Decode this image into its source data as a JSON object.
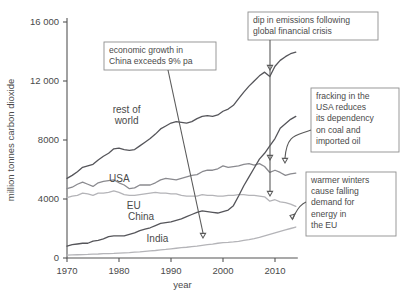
{
  "chart_data": {
    "type": "line",
    "title": "",
    "xlabel": "year",
    "ylabel": "million tonnes carbon dioxide",
    "xlim": [
      1970,
      2014
    ],
    "ylim": [
      0,
      16000
    ],
    "xticks": [
      "1970",
      "1980",
      "1990",
      "2000",
      "2010"
    ],
    "xtick_values": [
      1970,
      1980,
      1990,
      2000,
      2010
    ],
    "yticks": [
      "0",
      "4000",
      "8000",
      "12 000",
      "16 000"
    ],
    "ytick_values": [
      0,
      4000,
      8000,
      12000,
      16000
    ],
    "grid": false,
    "legend_position": "inline-labels",
    "x": [
      1970,
      1971,
      1972,
      1973,
      1974,
      1975,
      1976,
      1977,
      1978,
      1979,
      1980,
      1981,
      1982,
      1983,
      1984,
      1985,
      1986,
      1987,
      1988,
      1989,
      1990,
      1991,
      1992,
      1993,
      1994,
      1995,
      1996,
      1997,
      1998,
      1999,
      2000,
      2001,
      2002,
      2003,
      2004,
      2005,
      2006,
      2007,
      2008,
      2009,
      2010,
      2011,
      2012,
      2013,
      2014
    ],
    "series": [
      {
        "name": "rest of world",
        "color": "#55555a",
        "label_x": 1988,
        "values": [
          5400,
          5600,
          5850,
          6150,
          6250,
          6350,
          6650,
          6900,
          7100,
          7400,
          7450,
          7350,
          7300,
          7350,
          7600,
          7850,
          8100,
          8400,
          8750,
          8950,
          9150,
          9250,
          9200,
          9150,
          9250,
          9450,
          9600,
          9650,
          9600,
          9700,
          9950,
          10100,
          10350,
          10800,
          11250,
          11650,
          12000,
          12350,
          12600,
          12300,
          13000,
          13400,
          13650,
          13850,
          13950
        ]
      },
      {
        "name": "USA",
        "color": "#8a8a8f",
        "label_x": 1982,
        "values": [
          4700,
          4800,
          5000,
          5150,
          5000,
          4850,
          5100,
          5200,
          5250,
          5300,
          5100,
          4950,
          4700,
          4750,
          4950,
          4950,
          4950,
          5100,
          5300,
          5400,
          5350,
          5300,
          5400,
          5500,
          5600,
          5650,
          5850,
          5950,
          5950,
          6050,
          6250,
          6150,
          6200,
          6250,
          6350,
          6400,
          6300,
          6400,
          6200,
          5800,
          5950,
          5800,
          5600,
          5700,
          5750
        ]
      },
      {
        "name": "EU",
        "color": "#b4b4b8",
        "label_x": 1984,
        "values": [
          4100,
          4200,
          4250,
          4400,
          4350,
          4250,
          4400,
          4400,
          4450,
          4550,
          4450,
          4300,
          4250,
          4250,
          4300,
          4350,
          4400,
          4450,
          4400,
          4400,
          4350,
          4350,
          4250,
          4200,
          4200,
          4200,
          4300,
          4250,
          4250,
          4200,
          4200,
          4250,
          4250,
          4300,
          4300,
          4250,
          4250,
          4200,
          4150,
          3850,
          3950,
          3800,
          3750,
          3650,
          3500
        ]
      },
      {
        "name": "China",
        "color": "#55555a",
        "label_x": 1985,
        "values": [
          800,
          900,
          950,
          1000,
          1000,
          1150,
          1200,
          1300,
          1450,
          1500,
          1500,
          1500,
          1600,
          1700,
          1850,
          1950,
          2050,
          2200,
          2350,
          2400,
          2450,
          2550,
          2650,
          2800,
          2950,
          3100,
          3200,
          3150,
          3100,
          3050,
          3150,
          3250,
          3550,
          4200,
          4900,
          5500,
          6100,
          6700,
          7100,
          7600,
          8100,
          8800,
          9100,
          9400,
          9600
        ]
      },
      {
        "name": "India",
        "color": "#b4b4b8",
        "label_x": 1987,
        "values": [
          200,
          210,
          220,
          230,
          240,
          260,
          270,
          290,
          300,
          310,
          330,
          350,
          370,
          400,
          420,
          450,
          480,
          510,
          550,
          580,
          620,
          660,
          700,
          730,
          770,
          810,
          860,
          900,
          940,
          1000,
          1040,
          1060,
          1090,
          1130,
          1200,
          1250,
          1320,
          1400,
          1500,
          1600,
          1700,
          1800,
          1900,
          2000,
          2100
        ]
      }
    ],
    "annotations": [
      {
        "id": "china-growth",
        "lines": [
          "economic growth in",
          "China exceeds 9% pa"
        ],
        "box": {
          "x": 104,
          "y": 42,
          "w": 112,
          "h": 28
        },
        "arrow_to": {
          "x": 203,
          "y": 238
        }
      },
      {
        "id": "financial-crisis",
        "lines": [
          "dip in emissions following",
          "global financial crisis"
        ],
        "box": {
          "x": 248,
          "y": 12,
          "w": 130,
          "h": 28
        },
        "arrow_to": [
          {
            "x": 269,
            "y": 70
          },
          {
            "x": 269,
            "y": 160
          },
          {
            "x": 269,
            "y": 196
          }
        ]
      },
      {
        "id": "usa-fracking",
        "lines": [
          "fracking in the",
          "USA reduces",
          "its dependency",
          "on coal and",
          "imported oil"
        ],
        "box": {
          "x": 311,
          "y": 88,
          "w": 88,
          "h": 64
        },
        "arrow_to": {
          "x": 285,
          "y": 163
        }
      },
      {
        "id": "eu-warm-winters",
        "lines": [
          "warmer winters",
          "cause falling",
          "demand for",
          "energy in",
          "the EU"
        ],
        "box": {
          "x": 306,
          "y": 172,
          "w": 90,
          "h": 64
        },
        "arrow_to": {
          "x": 291,
          "y": 212
        }
      }
    ]
  },
  "axes": {
    "x_label": "year",
    "y_label": "million tonnes carbon dioxide"
  }
}
